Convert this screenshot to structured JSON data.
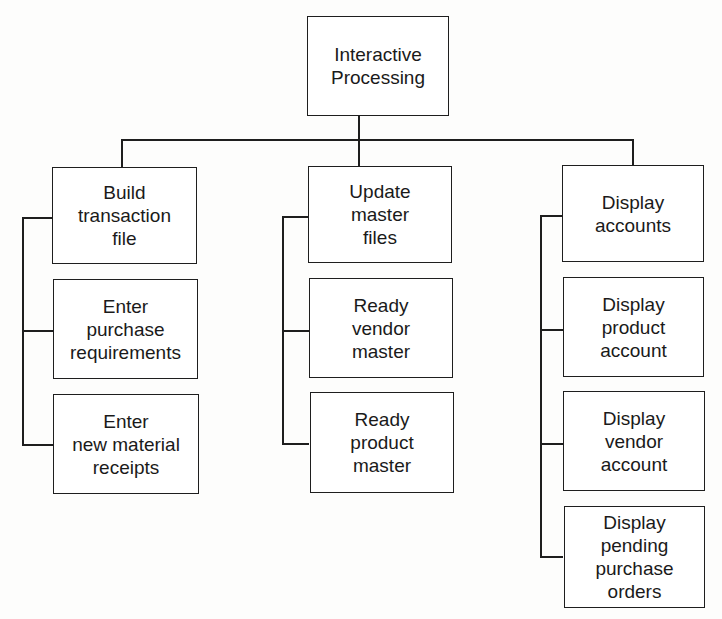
{
  "diagram": {
    "type": "hierarchy-chart",
    "root": {
      "label": "Interactive\nProcessing"
    },
    "columns": [
      {
        "items": [
          {
            "label": "Build\ntransaction\nfile"
          },
          {
            "label": "Enter\npurchase\nrequirements"
          },
          {
            "label": "Enter\nnew material\nreceipts"
          }
        ]
      },
      {
        "items": [
          {
            "label": "Update\nmaster\nfiles"
          },
          {
            "label": "Ready\nvendor\nmaster"
          },
          {
            "label": "Ready\nproduct\nmaster"
          }
        ]
      },
      {
        "items": [
          {
            "label": "Display\naccounts"
          },
          {
            "label": "Display\nproduct\naccount"
          },
          {
            "label": "Display\nvendor\naccount"
          },
          {
            "label": "Display\npending\npurchase\norders"
          }
        ]
      }
    ]
  },
  "colors": {
    "line": "#1e1e1e",
    "text": "#1a1a1a",
    "background": "#fdfdfc"
  }
}
